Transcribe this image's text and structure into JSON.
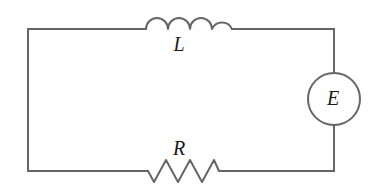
{
  "figure": {
    "kind": "circuit-diagram",
    "background_color": "#ffffff",
    "line_color": "#666666",
    "label_color": "#1a1a1a",
    "width": 378,
    "height": 191
  },
  "labels": {
    "inductor": "L",
    "resistor": "R",
    "source": "E"
  },
  "components": {
    "inductor": {
      "name": "inductor",
      "symbol": "coil",
      "humps": 4,
      "x_start": 146,
      "x_end": 232,
      "baseline_y": 29,
      "hump_radius": 11
    },
    "resistor": {
      "name": "resistor",
      "symbol": "zigzag",
      "peaks": 3,
      "x_start": 148,
      "x_end": 222,
      "baseline_y": 171,
      "amplitude": 11
    },
    "source": {
      "name": "emf-source",
      "symbol": "circle",
      "center_x": 334,
      "center_y": 99,
      "radius": 26
    }
  },
  "wires": {
    "top_left": {
      "x1": 28,
      "y1": 29,
      "x2": 146,
      "y2": 29
    },
    "top_right": {
      "x1": 232,
      "y1": 29,
      "x2": 334,
      "y2": 29
    },
    "left": {
      "x1": 28,
      "y1": 29,
      "x2": 28,
      "y2": 171
    },
    "bottom_left": {
      "x1": 28,
      "y1": 171,
      "x2": 148,
      "y2": 171
    },
    "bottom_right": {
      "x1": 222,
      "y1": 171,
      "x2": 334,
      "y2": 171
    },
    "right_upper": {
      "x1": 334,
      "y1": 29,
      "x2": 334,
      "y2": 73
    },
    "right_lower": {
      "x1": 334,
      "y1": 125,
      "x2": 334,
      "y2": 171
    }
  }
}
